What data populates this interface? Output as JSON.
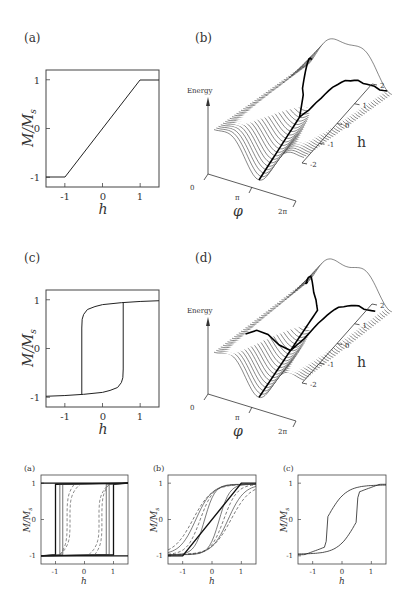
{
  "figure": {
    "top_row": {
      "panel_a": {
        "label": "(a)",
        "ylabel": "M/M_s",
        "ylabel_main": "M/M",
        "ylabel_sub": "s",
        "xlabel": "h",
        "yticks": [
          "1",
          "0",
          "-1"
        ],
        "xticks": [
          "-1",
          "0",
          "1"
        ],
        "curve": "linear ramp saturating at h = ±1"
      },
      "panel_b": {
        "label": "(b)",
        "energy_label": "Energy",
        "energy_zero": "0",
        "phi_label": "φ",
        "phi_ticks": [
          "π",
          "2π"
        ],
        "h_label": "h",
        "h_ticks": [
          "2",
          "1",
          "0",
          "-1",
          "-2"
        ]
      }
    },
    "middle_row": {
      "panel_c": {
        "label": "(c)",
        "ylabel_main": "M/M",
        "ylabel_sub": "s",
        "xlabel": "h",
        "yticks": [
          "1",
          "0",
          "-1"
        ],
        "xticks": [
          "-1",
          "0",
          "1"
        ],
        "curve": "square hysteresis loop, switching at h ≈ ±0.5"
      },
      "panel_d": {
        "label": "(d)",
        "energy_label": "Energy",
        "energy_zero": "0",
        "phi_label": "φ",
        "phi_ticks": [
          "π",
          "2π"
        ],
        "h_label": "h",
        "h_ticks": [
          "2",
          "1",
          "0",
          "-1",
          "-2"
        ]
      }
    },
    "bottom_row": {
      "panel_a": {
        "label": "(a)",
        "ylabel_main": "M/M",
        "ylabel_sub": "s",
        "xlabel": "h",
        "yticks": [
          "1",
          "0",
          "-1"
        ],
        "xticks": [
          "-1",
          "0",
          "1"
        ]
      },
      "panel_b": {
        "label": "(b)",
        "ylabel_main": "M/M",
        "ylabel_sub": "s",
        "xlabel": "h",
        "yticks": [
          "1",
          "0",
          "-1"
        ],
        "xticks": [
          "-1",
          "0",
          "1"
        ]
      },
      "panel_c": {
        "label": "(c)",
        "ylabel_main": "M/M",
        "ylabel_sub": "s",
        "xlabel": "h",
        "yticks": [
          "1",
          "0",
          "-1"
        ],
        "xticks": [
          "-1",
          "0",
          "1"
        ]
      }
    }
  },
  "chart_data": [
    {
      "id": "top-a",
      "type": "line",
      "title": "(a)",
      "xlabel": "h",
      "ylabel": "M/M_s",
      "xlim": [
        -1.5,
        1.5
      ],
      "ylim": [
        -1.2,
        1.2
      ],
      "series": [
        {
          "name": "magnetization",
          "x": [
            -1.5,
            -1,
            1,
            1.5
          ],
          "y": [
            -1,
            -1,
            1,
            1
          ]
        }
      ]
    },
    {
      "id": "top-b",
      "type": "surface-waterfall",
      "title": "(b)",
      "xlabel": "φ",
      "ylabel": "h",
      "zlabel": "Energy",
      "x_ticks": [
        "π",
        "2π"
      ],
      "y_ticks": [
        -2,
        -1,
        0,
        1,
        2
      ],
      "n_curves": 40,
      "annotation": "bold minimum-energy path forming a Y-shaped branch"
    },
    {
      "id": "mid-c",
      "type": "line",
      "title": "(c)",
      "xlabel": "h",
      "ylabel": "M/M_s",
      "xlim": [
        -1.5,
        1.5
      ],
      "ylim": [
        -1.2,
        1.2
      ],
      "series": [
        {
          "name": "upper branch",
          "x": [
            -0.55,
            -0.5,
            -0.3,
            0,
            0.5,
            1.5
          ],
          "y": [
            0.45,
            0.65,
            0.8,
            0.88,
            0.94,
            0.98
          ]
        },
        {
          "name": "lower branch",
          "x": [
            -1.5,
            -0.5,
            0,
            0.3,
            0.5,
            0.55
          ],
          "y": [
            -0.98,
            -0.94,
            -0.88,
            -0.8,
            -0.65,
            -0.45
          ]
        },
        {
          "name": "jumps",
          "x": [
            -0.55,
            0.55
          ],
          "y": [
            -0.95,
            0.95
          ]
        }
      ]
    },
    {
      "id": "mid-d",
      "type": "surface-waterfall",
      "title": "(d)",
      "xlabel": "φ",
      "ylabel": "h",
      "zlabel": "Energy",
      "x_ticks": [
        "π",
        "2π"
      ],
      "y_ticks": [
        -2,
        -1,
        0,
        1,
        2
      ],
      "n_curves": 40,
      "annotation": "bold path showing hysteretic switching"
    },
    {
      "id": "bot-a",
      "type": "line",
      "title": "(a)",
      "xlabel": "h",
      "ylabel": "M/M_s",
      "xlim": [
        -1.5,
        1.5
      ],
      "ylim": [
        -1.2,
        1.2
      ],
      "series": [
        {
          "name": "loop 1 (solid bold)",
          "coercivity": 1.0
        },
        {
          "name": "loop 2 (solid)",
          "coercivity": 0.85
        },
        {
          "name": "loop 3 (solid)",
          "coercivity": 0.7
        },
        {
          "name": "loop 4 (dashed)",
          "coercivity": 0.6
        },
        {
          "name": "loop 5 (dashed)",
          "coercivity": 0.55
        }
      ]
    },
    {
      "id": "bot-b",
      "type": "line",
      "title": "(b)",
      "xlabel": "h",
      "ylabel": "M/M_s",
      "xlim": [
        -1.5,
        1.5
      ],
      "ylim": [
        -1.2,
        1.2
      ],
      "series": [
        {
          "name": "bold linear",
          "x": [
            -1.5,
            -1,
            1,
            1.5
          ],
          "y": [
            -1,
            -1,
            1,
            1
          ]
        },
        {
          "name": "loops (solid/dashed)",
          "coercivities": [
            0.2,
            0.35,
            0.5,
            0.6
          ]
        }
      ]
    },
    {
      "id": "bot-c",
      "type": "line",
      "title": "(c)",
      "xlabel": "h",
      "ylabel": "M/M_s",
      "xlim": [
        -1.5,
        1.5
      ],
      "ylim": [
        -1.2,
        1.2
      ],
      "series": [
        {
          "name": "rounded hysteresis loop",
          "switch_field": 0.5
        }
      ]
    }
  ]
}
